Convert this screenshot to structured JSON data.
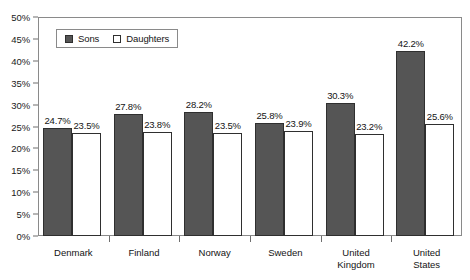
{
  "chart_data": {
    "type": "bar",
    "title": "",
    "xlabel": "",
    "ylabel": "",
    "ylim": [
      0,
      50
    ],
    "y_tick_labels": [
      "0%",
      "5%",
      "10%",
      "15%",
      "20%",
      "25%",
      "30%",
      "35%",
      "40%",
      "45%",
      "50%"
    ],
    "y_tick_values": [
      0,
      5,
      10,
      15,
      20,
      25,
      30,
      35,
      40,
      45,
      50
    ],
    "grid": false,
    "legend_position": "upper-left-inside",
    "categories": [
      "Denmark",
      "Finland",
      "Norway",
      "Sweden",
      "United Kingdom",
      "United States"
    ],
    "series": [
      {
        "name": "Sons",
        "color": "#555555",
        "values": [
          24.7,
          27.8,
          28.2,
          25.8,
          30.3,
          42.2
        ],
        "labels": [
          "24.7%",
          "27.8%",
          "28.2%",
          "25.8%",
          "30.3%",
          "42.2%"
        ]
      },
      {
        "name": "Daughters",
        "color": "#ffffff",
        "values": [
          23.5,
          23.8,
          23.5,
          23.9,
          23.2,
          25.6
        ],
        "labels": [
          "23.5%",
          "23.8%",
          "23.5%",
          "23.9%",
          "23.2%",
          "25.6%"
        ]
      }
    ]
  },
  "legend": {
    "items": [
      {
        "label": "Sons",
        "swatch": "filled-dark-swatch"
      },
      {
        "label": "Daughters",
        "swatch": "open-white-swatch"
      }
    ]
  },
  "colors": {
    "sons_fill": "#555555",
    "daughters_fill": "#ffffff",
    "bar_outline": "#2f2f2f",
    "frame": "#8a8a8a",
    "text": "#141414",
    "background": "#ffffff"
  }
}
